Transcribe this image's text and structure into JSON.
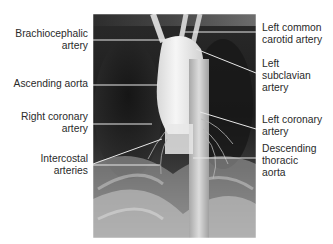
{
  "figure": {
    "type": "labeled angiogram",
    "image_description": "Aortogram (thoracic aorta angiography), frontal view",
    "left_labels": [
      {
        "lines": [
          "Brachiocephalic",
          "artery"
        ]
      },
      {
        "lines": [
          "Ascending aorta"
        ]
      },
      {
        "lines": [
          "Right coronary",
          "artery"
        ]
      },
      {
        "lines": [
          "Intercostal",
          "arteries"
        ]
      }
    ],
    "right_labels": [
      {
        "lines": [
          "Left common",
          "carotid artery"
        ]
      },
      {
        "lines": [
          "Left",
          "subclavian",
          "artery"
        ]
      },
      {
        "lines": [
          "Left coronary",
          "artery"
        ]
      },
      {
        "lines": [
          "Descending",
          "thoracic",
          "aorta"
        ]
      }
    ],
    "colors": {
      "label_text": "#2a2a2a",
      "leader_line": "#e8e8e8",
      "background": "#ffffff"
    }
  }
}
